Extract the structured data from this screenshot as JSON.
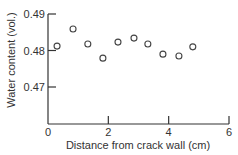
{
  "chart_data": {
    "type": "scatter",
    "title": "",
    "xlabel": "Distance from crack wall (cm)",
    "ylabel": "Water content (vol.)",
    "xlim": [
      0,
      6
    ],
    "ylim": [
      0.46,
      0.49
    ],
    "x_ticks": [
      0,
      2,
      4,
      6
    ],
    "x_tick_labels": [
      "0",
      "2",
      "4",
      "6"
    ],
    "y_ticks": [
      0.47,
      0.48,
      0.49
    ],
    "y_tick_labels": [
      "0.47",
      "0.48",
      "0.49"
    ],
    "grid": false,
    "legend": null,
    "marker": "open-circle",
    "series": [
      {
        "name": "Water content",
        "x": [
          0.3,
          0.83,
          1.32,
          1.82,
          2.32,
          2.85,
          3.31,
          3.81,
          4.34,
          4.8
        ],
        "y": [
          0.4812,
          0.4859,
          0.4818,
          0.4779,
          0.4823,
          0.4834,
          0.4818,
          0.479,
          0.4785,
          0.481
        ]
      }
    ]
  },
  "colors": {
    "axis": "#333333",
    "marker": "#444444",
    "background": "#ffffff"
  }
}
